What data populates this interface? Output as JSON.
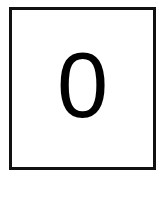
{
  "card": {
    "digit": "0",
    "border_color": "#111111",
    "text_color": "#000000"
  }
}
